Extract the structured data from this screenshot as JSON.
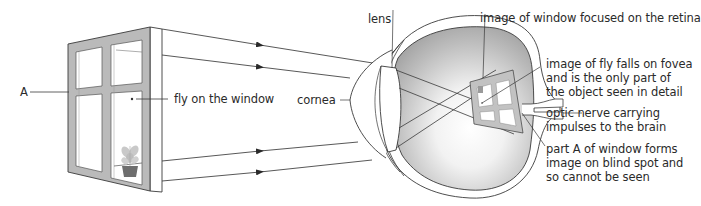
{
  "diagram": {
    "labels": {
      "point_a": "A",
      "fly_on_window": "fly on the window",
      "cornea": "cornea",
      "lens": "lens",
      "image_on_retina": "image of window focused on the retina",
      "fly_on_fovea": "image of fly falls on fovea\nand is the only part of\nthe object seen in detail",
      "optic_nerve": "optic nerve carrying\nimpulses to the brain",
      "blind_spot": "part A of window forms\nimage on blind spot and\nso cannot be seen"
    },
    "colors": {
      "line": "#3a3a3a",
      "frame_fill": "#b9b9b9",
      "eye_interior_dark": "#a8a8a8",
      "eye_interior_light": "#ffffff",
      "text": "#2a2a2a"
    },
    "components": [
      "window",
      "light rays",
      "cornea",
      "lens",
      "eyeball",
      "retina",
      "fovea",
      "blind spot",
      "optic nerve"
    ]
  }
}
